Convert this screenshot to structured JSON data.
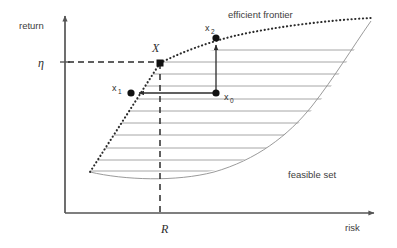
{
  "figure": {
    "axes": {
      "y_label": "return",
      "x_label": "risk",
      "y_tick_label": "η",
      "x_tick_label": "R",
      "axis_color": "#555555"
    },
    "annotations": {
      "efficient_frontier": "efficient frontier",
      "feasible_set": "feasible set",
      "point_X": "X",
      "point_x0_base": "x",
      "point_x0_sub": "0",
      "point_x1_base": "x",
      "point_x1_sub": "1",
      "point_x2_base": "x",
      "point_x2_sub": "2"
    },
    "colors": {
      "frontier_dotted": "#2b2b2b",
      "hatch_line": "#8f8f8f",
      "boundary_line": "#8f8f8f",
      "arrow_line": "#2b2b2b",
      "dashed_guide": "#2b2b2b",
      "point_fill": "#111111",
      "background": "#ffffff"
    },
    "geometry": {
      "y_axis_x": 65,
      "x_axis_y": 213,
      "eta_level_y": 62,
      "R_level_x": 165,
      "point_X": [
        160,
        63
      ],
      "point_x0": [
        216,
        93
      ],
      "point_x1": [
        131,
        93
      ],
      "point_x2": [
        216,
        38
      ],
      "hatch_rows": [
        50,
        62,
        74,
        86,
        99,
        111,
        123,
        135,
        148,
        160,
        171
      ]
    }
  }
}
